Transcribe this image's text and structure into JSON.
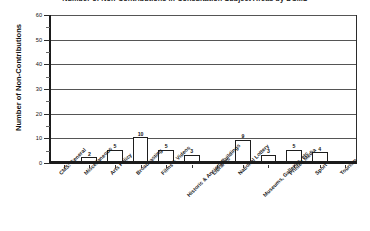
{
  "chart_data": {
    "type": "bar",
    "title": "Number of Non-Contributions in Consultation Subject Areas by DCMS",
    "xlabel": "",
    "ylabel": "Number of Non-Contributions",
    "ylim": [
      0,
      60
    ],
    "yticks": [
      0,
      10,
      20,
      30,
      40,
      50,
      60
    ],
    "ytick_labels": [
      "0",
      "10",
      "20",
      "30",
      "40",
      "50",
      "60"
    ],
    "minor_tick_step": 5,
    "grid": true,
    "legend": "none",
    "bar_color": "#ffffff",
    "bar_edge_color": "#1e1e1e",
    "axis_color": "#1b1b1b",
    "show_value_labels": true,
    "categories": [
      "CMS: General",
      "Miscellaneous",
      "Arts Policy",
      "Broadcasting",
      "Films & Videos",
      "Historic & Ancient Buildings",
      "Libraries",
      "National Lottery",
      "Museums, Galleries, etc",
      "Printed Media",
      "Sport",
      "Tourism"
    ],
    "values": [
      0,
      2,
      5,
      10,
      5,
      3,
      0,
      9,
      3,
      5,
      4,
      0
    ],
    "value_labels": [
      "",
      "2",
      "5",
      "10",
      "5",
      "3",
      "",
      "9",
      "3",
      "5",
      "4",
      ""
    ]
  }
}
